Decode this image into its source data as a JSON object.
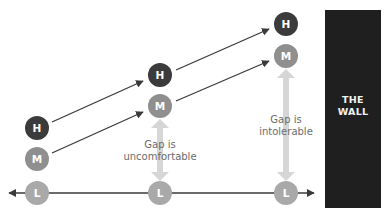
{
  "wall": {
    "line1": "THE",
    "line2": "WALL",
    "color": "#1f1f1f"
  },
  "nodes": {
    "col1": {
      "high": "H",
      "medium": "M",
      "low": "L"
    },
    "col2": {
      "high": "H",
      "medium": "M",
      "low": "L"
    },
    "col3": {
      "high": "H",
      "medium": "M",
      "low": "L"
    }
  },
  "gaps": {
    "col2": {
      "line1": "Gap is",
      "line2": "uncomfortable"
    },
    "col3": {
      "line1": "Gap is",
      "line2": "intolerable"
    }
  },
  "colors": {
    "high": "#3b3b3b",
    "medium": "#8f8f8f",
    "low": "#a9a9a9",
    "gap_arrow": "#d6d6d6",
    "line": "#3a3a3a",
    "gap_text": "#6b6b6b"
  }
}
